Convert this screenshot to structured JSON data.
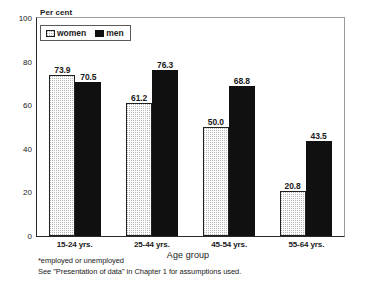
{
  "chart_data": {
    "type": "bar",
    "title": "",
    "xlabel": "Age group",
    "ylabel": "Per cent",
    "ylim": [
      0,
      100
    ],
    "yticks": [
      0,
      20,
      40,
      60,
      80,
      100
    ],
    "ytick_labels": [
      "0",
      "20",
      "40",
      "60",
      "80",
      "100"
    ],
    "grid": false,
    "legend_position": "top-left",
    "categories": [
      "15-24 yrs.",
      "25-44 yrs.",
      "45-54 yrs.",
      "55-64 yrs."
    ],
    "series": [
      {
        "name": "women",
        "values": [
          73.9,
          61.2,
          50.0,
          20.8
        ],
        "labels": [
          "73.9",
          "61.2",
          "50.0",
          "20.8"
        ],
        "fill": "dotted-gray",
        "color": "#b9b9b9"
      },
      {
        "name": "men",
        "values": [
          70.5,
          76.3,
          68.8,
          43.5
        ],
        "labels": [
          "70.5",
          "76.3",
          "68.8",
          "43.5"
        ],
        "fill": "solid-black",
        "color": "#101010"
      }
    ],
    "annotations": [
      "*employed or unemployed",
      "See \"Presentation of data\" in Chapter 1 for assumptions used."
    ]
  },
  "legend": {
    "items": [
      {
        "label": "women"
      },
      {
        "label": "men"
      }
    ]
  },
  "footnotes": [
    "*employed or unemployed",
    "See \"Presentation of data\" in Chapter 1 for assumptions used."
  ]
}
